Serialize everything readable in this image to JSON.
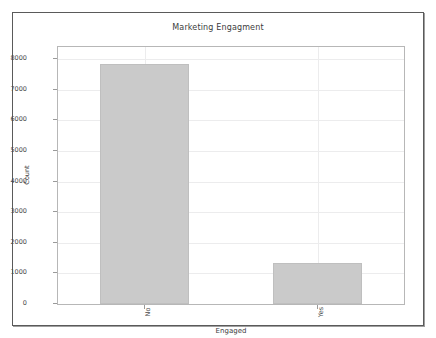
{
  "chart_data": {
    "type": "bar",
    "title": "Marketing Engagment",
    "xlabel": "Engaged",
    "ylabel": "Count",
    "categories": [
      "No",
      "Yes"
    ],
    "values": [
      7850,
      1350
    ],
    "ylim": [
      0,
      8400
    ],
    "yticks": [
      0,
      1000,
      2000,
      3000,
      4000,
      5000,
      6000,
      7000,
      8000
    ],
    "ytick_labels": [
      "0",
      "1000",
      "2000",
      "3000",
      "4000",
      "5000",
      "6000",
      "7000",
      "8000"
    ],
    "xtick_labels": [
      "No",
      "Yes"
    ],
    "grid": true,
    "legend": null,
    "bar_color": "#cacaca",
    "bar_edge_color": "#bfbfbf",
    "grid_color": "#ececed",
    "axes_edge_color": "#b7b7b7",
    "figure_edge_color": "#5a5a5a",
    "background_color": "#ffffff",
    "xtick_rotation": -90
  }
}
